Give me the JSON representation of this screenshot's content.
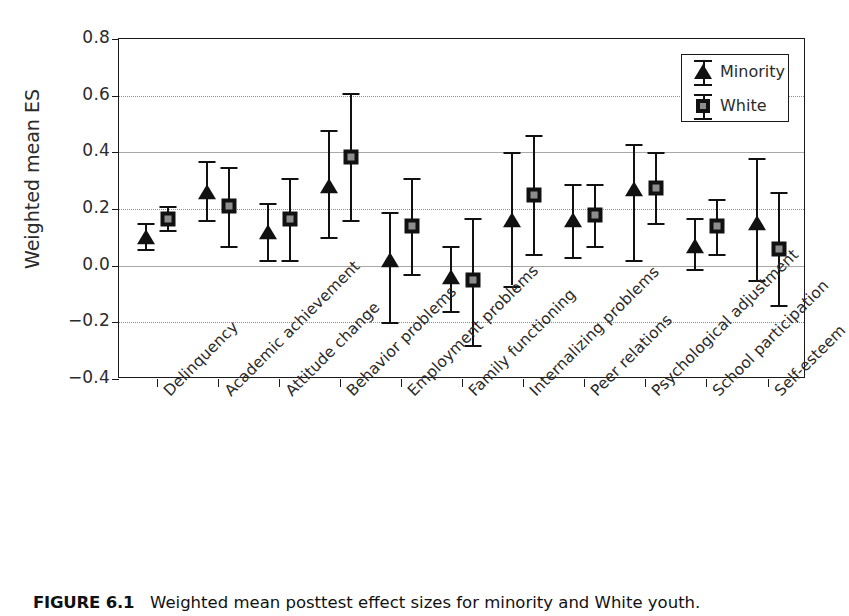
{
  "figure": {
    "caption_label": "FIGURE 6.1",
    "caption_text": "Weighted mean posttest effect sizes for minority and White youth."
  },
  "axes": {
    "ylabel": "Weighted mean ES",
    "yticks": [
      "0.8",
      "0.6",
      "0.4",
      "0.2",
      "0.0",
      "−0.2",
      "−0.4"
    ],
    "ylim_low": -0.4,
    "ylim_high": 0.8
  },
  "legend": {
    "position": "top-right",
    "entries": [
      {
        "label": "Minority",
        "marker": "triangle-icon"
      },
      {
        "label": "White",
        "marker": "square-icon"
      }
    ]
  },
  "chart_data": {
    "type": "scatter",
    "title": "",
    "subtitle": "",
    "xlabel": "",
    "ylabel": "Weighted mean ES",
    "ylim": [
      -0.4,
      0.8
    ],
    "yticks": [
      -0.4,
      -0.2,
      0.0,
      0.2,
      0.4,
      0.6,
      0.8
    ],
    "grid": true,
    "legend": [
      "Minority",
      "White"
    ],
    "error_bars": "95% confidence interval",
    "categories": [
      "Delinquency",
      "Academic achievement",
      "Attitude change",
      "Behavior problems",
      "Employment problems",
      "Family functioning",
      "Internalizing problems",
      "Peer relations",
      "Psychological adjustment",
      "School participation",
      "Self-esteem"
    ],
    "series": [
      {
        "name": "Minority",
        "marker": "triangle",
        "values": [
          0.1,
          0.26,
          0.12,
          0.28,
          0.02,
          -0.04,
          0.16,
          0.16,
          0.27,
          0.07,
          0.15
        ],
        "ci_low": [
          0.06,
          0.16,
          0.02,
          0.1,
          -0.2,
          -0.16,
          -0.07,
          0.03,
          0.02,
          -0.01,
          -0.05
        ],
        "ci_high": [
          0.15,
          0.37,
          0.22,
          0.48,
          0.19,
          0.07,
          0.4,
          0.29,
          0.43,
          0.17,
          0.38
        ]
      },
      {
        "name": "White",
        "marker": "square",
        "values": [
          0.165,
          0.21,
          0.165,
          0.385,
          0.14,
          -0.05,
          0.25,
          0.18,
          0.275,
          0.14,
          0.06
        ],
        "ci_low": [
          0.125,
          0.07,
          0.02,
          0.16,
          -0.03,
          -0.28,
          0.04,
          0.07,
          0.15,
          0.04,
          -0.14
        ],
        "ci_high": [
          0.21,
          0.35,
          0.31,
          0.61,
          0.31,
          0.17,
          0.46,
          0.29,
          0.4,
          0.235,
          0.26
        ]
      }
    ]
  }
}
